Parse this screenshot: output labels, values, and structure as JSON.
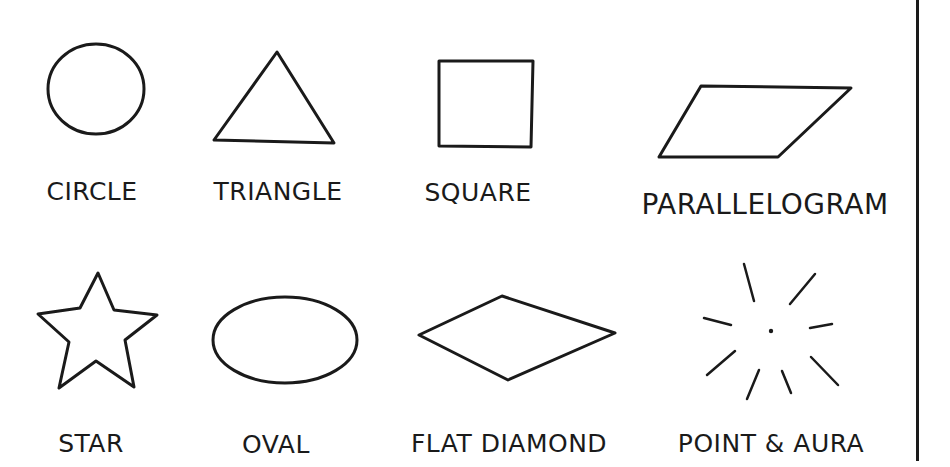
{
  "colors": {
    "ink": "#1a1a1a",
    "background": "#ffffff"
  },
  "shapes": [
    {
      "id": "circle",
      "label": "CIRCLE"
    },
    {
      "id": "triangle",
      "label": "TRIANGLE"
    },
    {
      "id": "square",
      "label": "SQUARE"
    },
    {
      "id": "parallelogram",
      "label": "PARALLELOGRAM"
    },
    {
      "id": "star",
      "label": "STAR"
    },
    {
      "id": "oval",
      "label": "OVAL"
    },
    {
      "id": "flat-diamond",
      "label": "FLAT DIAMOND"
    },
    {
      "id": "point-aura",
      "label": "POINT & AURA"
    }
  ]
}
